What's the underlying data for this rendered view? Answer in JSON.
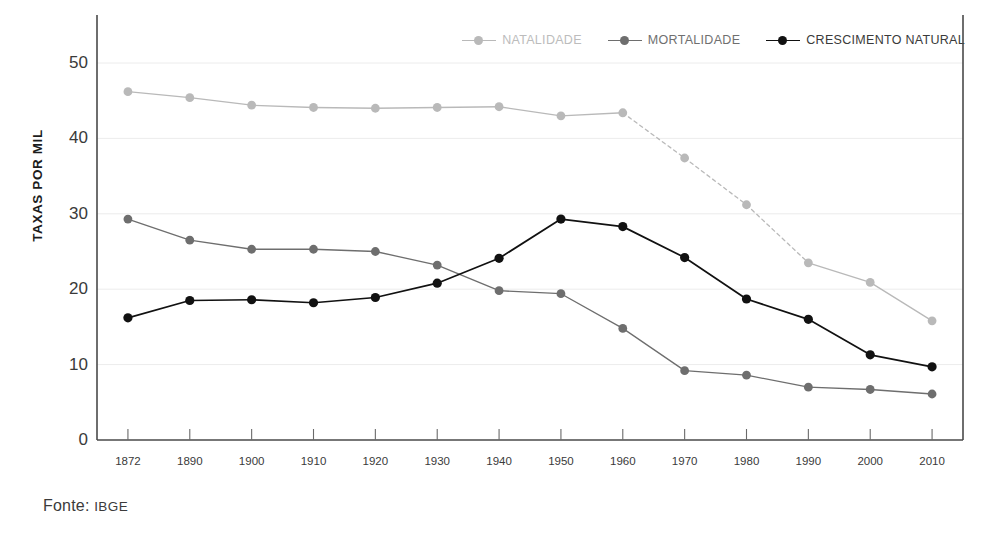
{
  "footer": {
    "label": "Fonte:",
    "source": "IBGE"
  },
  "axes": {
    "ylabel": "TAXAS POR MIL",
    "y_ticks": [
      "0",
      "10",
      "20",
      "30",
      "40",
      "50"
    ],
    "x_ticks": [
      "1872",
      "1890",
      "1900",
      "1910",
      "1920",
      "1930",
      "1940",
      "1950",
      "1960",
      "1970",
      "1980",
      "1990",
      "2000",
      "2010"
    ]
  },
  "legend": {
    "position": "top-right",
    "entries": [
      {
        "label": "NATALIDADE",
        "color": "#b9b9b9"
      },
      {
        "label": "MORTALIDADE",
        "color": "#6e6e6e"
      },
      {
        "label": "CRESCIMENTO NATURAL",
        "color": "#111111"
      }
    ]
  },
  "colors": {
    "natalidade": "#b9b9b9",
    "mortalidade": "#6e6e6e",
    "crescimento": "#111111",
    "grid": "#ececec",
    "axis": "#3a3a3a",
    "background": "#ffffff"
  },
  "chart_data": {
    "type": "line",
    "title": "",
    "subtitle": "",
    "xlabel": "",
    "ylabel": "TAXAS POR MIL",
    "categories": [
      "1872",
      "1890",
      "1900",
      "1910",
      "1920",
      "1930",
      "1940",
      "1950",
      "1960",
      "1970",
      "1980",
      "1990",
      "2000",
      "2010"
    ],
    "ylim": [
      0,
      50
    ],
    "ytick_step": 10,
    "grid": true,
    "legend_position": "top-right",
    "source": "Fonte: IBGE",
    "series": [
      {
        "name": "NATALIDADE",
        "color": "#b9b9b9",
        "style": "solid-with-dashed-segment",
        "dashed_from": "1960",
        "dashed_to": "1990",
        "values": [
          46.2,
          45.4,
          44.4,
          44.1,
          44.0,
          44.1,
          44.2,
          43.0,
          43.4,
          37.4,
          31.2,
          23.5,
          20.9,
          15.8
        ]
      },
      {
        "name": "MORTALIDADE",
        "color": "#6e6e6e",
        "style": "solid",
        "values": [
          29.3,
          26.5,
          25.3,
          25.3,
          25.0,
          23.2,
          19.8,
          19.4,
          14.8,
          9.2,
          8.6,
          7.0,
          6.7,
          6.1
        ]
      },
      {
        "name": "CRESCIMENTO NATURAL",
        "color": "#111111",
        "style": "solid",
        "values": [
          16.2,
          18.5,
          18.6,
          18.2,
          18.9,
          20.8,
          24.1,
          29.3,
          28.3,
          24.2,
          18.7,
          16.0,
          11.3,
          9.7
        ]
      }
    ]
  }
}
